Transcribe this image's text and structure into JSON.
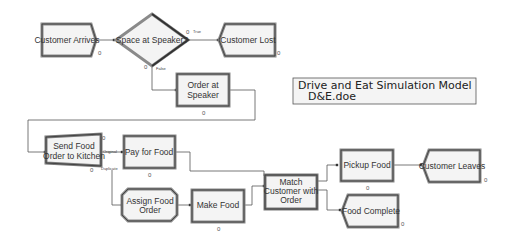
{
  "diagram": {
    "modules": [
      {
        "id": "customer-arrives",
        "label": "Customer Arrives",
        "type": "create",
        "counter": "0"
      },
      {
        "id": "space-at-speaker",
        "label": "Space at Speaker?",
        "type": "decide",
        "true_label": "True",
        "false_label": "False",
        "counter_true": "0",
        "counter_false": "0"
      },
      {
        "id": "customer-lost",
        "label": "Customer Lost",
        "type": "dispose",
        "counter": "0"
      },
      {
        "id": "order-at-speaker",
        "lines": [
          "Order at",
          "Speaker"
        ],
        "type": "process",
        "counter": "0"
      },
      {
        "id": "send-food-order",
        "lines": [
          "Send Food",
          "Order to Kitchen"
        ],
        "type": "separate",
        "original_label": "Original",
        "duplicate_label": "Duplicate",
        "counter_top": "0",
        "counter_bottom": "0"
      },
      {
        "id": "pay-for-food",
        "label": "Pay for Food",
        "type": "process",
        "counter": "0"
      },
      {
        "id": "assign-food-order",
        "lines": [
          "Assign Food",
          "Order"
        ],
        "type": "assign"
      },
      {
        "id": "make-food",
        "label": "Make Food",
        "type": "process",
        "counter": "0"
      },
      {
        "id": "match-customer",
        "lines": [
          "Match",
          "Customer with",
          "Order"
        ],
        "type": "match"
      },
      {
        "id": "pickup-food",
        "label": "Pickup Food",
        "type": "process",
        "counter": "0"
      },
      {
        "id": "customer-leaves",
        "label": "Customer Leaves",
        "type": "dispose",
        "counter": "0"
      },
      {
        "id": "food-complete",
        "label": "Food Complete",
        "type": "dispose",
        "counter": "0"
      }
    ],
    "title_box": {
      "line1": "Drive and Eat Simulation Model",
      "line2": "D&E.doe"
    }
  },
  "colors": {
    "border_dark": "#3a3a3a",
    "border_mid": "#8a8a8a",
    "fill": "#f4f4f4",
    "line": "#555555"
  }
}
